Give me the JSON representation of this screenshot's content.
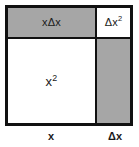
{
  "diagram": {
    "type": "area-model-square",
    "colors": {
      "shaded": "#a6a6a6",
      "unshaded": "#ffffff",
      "outline": "#111111",
      "text": "#1a1a1a"
    },
    "regions": [
      {
        "id": "top-left",
        "label_base": "xΔx",
        "label_exponent": "",
        "fill": "shaded",
        "meaning": "x times delta x"
      },
      {
        "id": "top-right",
        "label_base": "Δx",
        "label_exponent": "2",
        "fill": "unshaded",
        "meaning": "delta x squared"
      },
      {
        "id": "bottom-left",
        "label_base": "x",
        "label_exponent": "2",
        "fill": "unshaded",
        "meaning": "x squared"
      },
      {
        "id": "bottom-right",
        "label_base": "",
        "label_exponent": "",
        "fill": "shaded",
        "meaning": "x times delta x (unlabeled)"
      }
    ],
    "axis": {
      "bottom_left_label": "x",
      "bottom_right_label": "Δx"
    }
  }
}
